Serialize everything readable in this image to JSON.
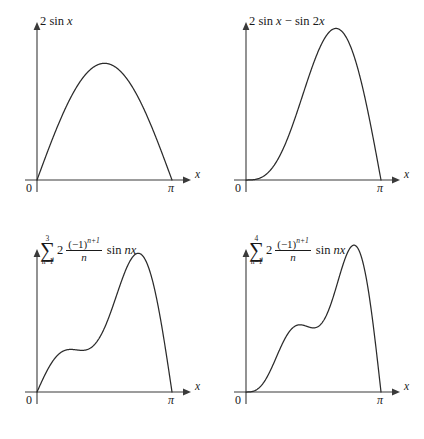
{
  "figure": {
    "background": "#ffffff",
    "curve_color": "#2b2b2b",
    "axis_color": "#3a3a3a",
    "columns": 2,
    "rows": 2
  },
  "axes_labels": {
    "x_axis": "x",
    "origin": "0",
    "pi": "π"
  },
  "panels": [
    {
      "id": "panel-top-left",
      "title_type": "simple",
      "title_text": "2 sin x",
      "title_parts": {
        "lead": "2 sin ",
        "variable": "x"
      }
    },
    {
      "id": "panel-top-right",
      "title_type": "simple",
      "title_text": "2 sin x − sin 2x",
      "title_parts": {
        "lead": "2 sin ",
        "variable": "x",
        "tail_lead": " − sin 2",
        "tail_variable": "x"
      }
    },
    {
      "id": "panel-bottom-left",
      "title_type": "summation",
      "title_text": "∑ (n=1 to 3) 2 ((−1)^(n+1)/n) sin nx",
      "title_parts": {
        "upper": "3",
        "lower": "n=1",
        "sigma": "∑",
        "coefficient": "2",
        "numerator": "(−1)",
        "numerator_exponent": "n+1",
        "denominator": "n",
        "trig": "sin ",
        "trig_arg": "nx"
      }
    },
    {
      "id": "panel-bottom-right",
      "title_type": "summation",
      "title_text": "∑ (n=1 to 4) 2 ((−1)^(n+1)/n) sin nx",
      "title_parts": {
        "upper": "4",
        "lower": "n=1",
        "sigma": "∑",
        "coefficient": "2",
        "numerator": "(−1)",
        "numerator_exponent": "n+1",
        "denominator": "n",
        "trig": "sin ",
        "trig_arg": "nx"
      }
    }
  ],
  "chart_data": [
    {
      "type": "line",
      "title": "2 sin x",
      "xlabel": "x",
      "ylabel": "",
      "xlim": [
        0,
        3.14159265
      ],
      "ylim": [
        0,
        2.4
      ],
      "xtick_labels": [
        "0",
        "π"
      ],
      "xtick_values": [
        0,
        3.14159265
      ],
      "grid": false,
      "legend": "none",
      "series": [
        {
          "name": "2 sin x",
          "terms": [
            {
              "n": 1,
              "amplitude": 2
            }
          ],
          "peak_value": 2.0,
          "peak_x": 1.5708,
          "endpoints": [
            0,
            0
          ]
        }
      ]
    },
    {
      "type": "line",
      "title": "2 sin x − sin 2x",
      "xlabel": "x",
      "ylabel": "",
      "xlim": [
        0,
        3.14159265
      ],
      "ylim": [
        0,
        2.4
      ],
      "xtick_labels": [
        "0",
        "π"
      ],
      "xtick_values": [
        0,
        3.14159265
      ],
      "grid": false,
      "legend": "none",
      "series": [
        {
          "name": "2 sin x - sin 2x",
          "terms": [
            {
              "n": 1,
              "amplitude": 2
            },
            {
              "n": 2,
              "amplitude": -1
            }
          ],
          "peak_value": 2.6,
          "peak_x": 2.0,
          "endpoints": [
            0,
            0
          ]
        }
      ]
    },
    {
      "type": "line",
      "title": "partial sum n=1..3",
      "xlabel": "x",
      "ylabel": "",
      "xlim": [
        0,
        3.14159265
      ],
      "ylim": [
        0,
        2.6
      ],
      "xtick_labels": [
        "0",
        "π"
      ],
      "xtick_values": [
        0,
        3.14159265
      ],
      "grid": false,
      "legend": "none",
      "series": [
        {
          "name": "sum n=1..3",
          "terms": [
            {
              "n": 1,
              "amplitude": 2
            },
            {
              "n": 2,
              "amplitude": -1
            },
            {
              "n": 3,
              "amplitude": 0.6666667
            }
          ],
          "peak_value": 2.43,
          "peak_x": 2.32,
          "endpoints": [
            0,
            0
          ]
        }
      ]
    },
    {
      "type": "line",
      "title": "partial sum n=1..4",
      "xlabel": "x",
      "ylabel": "",
      "xlim": [
        0,
        3.14159265
      ],
      "ylim": [
        0,
        2.6
      ],
      "xtick_labels": [
        "0",
        "π"
      ],
      "xtick_values": [
        0,
        3.14159265
      ],
      "grid": false,
      "legend": "none",
      "series": [
        {
          "name": "sum n=1..4",
          "terms": [
            {
              "n": 1,
              "amplitude": 2
            },
            {
              "n": 2,
              "amplitude": -1
            },
            {
              "n": 3,
              "amplitude": 0.6666667
            },
            {
              "n": 4,
              "amplitude": -0.5
            }
          ],
          "peak_value": 2.5,
          "peak_x": 2.45,
          "endpoints": [
            0,
            0
          ]
        }
      ]
    }
  ]
}
